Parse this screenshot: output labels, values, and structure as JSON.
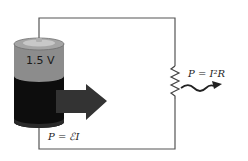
{
  "diagram": {
    "battery": {
      "voltage_label": "1.5 V"
    },
    "source_power_label": "P = ℰI",
    "resistor_power_label": "P = I²R",
    "colors": {
      "wire": "#555555",
      "battery_top": "#9a9a9a",
      "battery_band": "#8c8c8c",
      "battery_body": "#0d0d0d",
      "arrow": "#333333",
      "heat_arrow": "#222222"
    }
  }
}
